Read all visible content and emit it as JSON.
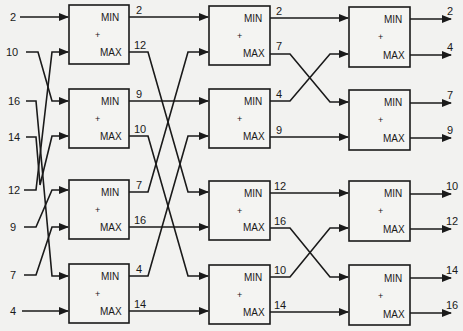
{
  "colors": {
    "line": "#1a1a1a",
    "background": "#f2f2f0"
  },
  "labels": {
    "min": "MIN",
    "max": "MAX",
    "plus": "+"
  },
  "inputs": [
    "2",
    "10",
    "16",
    "14",
    "12",
    "9",
    "7",
    "4"
  ],
  "stage1": {
    "outputs": [
      "2",
      "12",
      "9",
      "10",
      "7",
      "16",
      "4",
      "14"
    ]
  },
  "stage2": {
    "outputs": [
      "2",
      "7",
      "4",
      "9",
      "12",
      "16",
      "10",
      "14"
    ]
  },
  "stage3": {
    "outputs": [
      "2",
      "4",
      "7",
      "9",
      "10",
      "12",
      "14",
      "16"
    ]
  }
}
